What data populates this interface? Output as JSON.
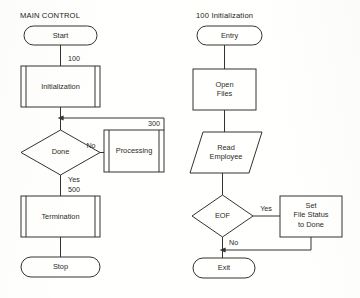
{
  "diagram": {
    "background_color": "#fffffd",
    "line_color": "#35332f",
    "text_color": "#2b2a27"
  },
  "panels": {
    "left": {
      "title": "MAIN CONTROL",
      "nodes": {
        "start": {
          "label": "Start",
          "type": "terminator"
        },
        "initialization": {
          "label": "Initialization",
          "type": "predefined-process"
        },
        "done": {
          "label": "Done",
          "type": "decision"
        },
        "processing": {
          "label": "Processing",
          "type": "predefined-process"
        },
        "termination": {
          "label": "Termination",
          "type": "predefined-process"
        },
        "stop": {
          "label": "Stop",
          "type": "terminator"
        }
      },
      "edge_labels": {
        "initialization_ref": "100",
        "processing_ref": "300",
        "termination_ref": "500",
        "done_no": "No",
        "done_yes": "Yes"
      }
    },
    "right": {
      "title": "100 Initialization",
      "nodes": {
        "entry": {
          "label": "Entry",
          "type": "terminator"
        },
        "open_files": {
          "label_line1": "Open",
          "label_line2": "Files",
          "type": "process"
        },
        "read_employee": {
          "label_line1": "Read",
          "label_line2": "Employee",
          "type": "input-output"
        },
        "eof": {
          "label": "EOF",
          "type": "decision"
        },
        "set_file_status": {
          "label_line1": "Set",
          "label_line2": "File Status",
          "label_line3": "to Done",
          "type": "process"
        },
        "exit": {
          "label": "Exit",
          "type": "terminator"
        }
      },
      "edge_labels": {
        "eof_yes": "Yes",
        "eof_no": "No"
      }
    }
  }
}
